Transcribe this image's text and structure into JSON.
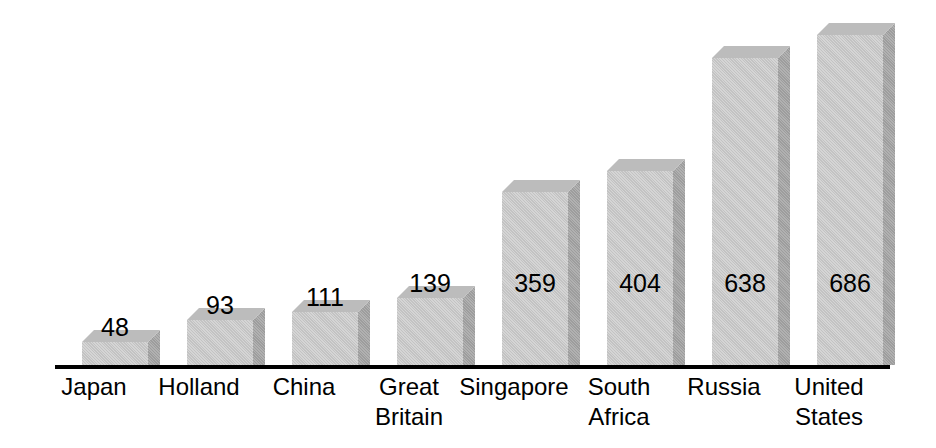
{
  "chart_data": {
    "type": "bar",
    "title": "",
    "subtitle": "",
    "xlabel": "",
    "ylabel": "",
    "grid": false,
    "legend": "none",
    "style": "3d-block-bars-grayscale",
    "axis_line": true,
    "y_axis_visible": false,
    "ylim": [
      0,
      686
    ],
    "categories": [
      "Japan",
      "Holland",
      "China",
      "Great Britain",
      "Singapore",
      "South Africa",
      "Russia",
      "United States"
    ],
    "values": [
      48,
      93,
      111,
      139,
      359,
      404,
      638,
      686
    ],
    "value_label_position": [
      "above",
      "above",
      "above",
      "above",
      "inside",
      "inside",
      "inside",
      "inside"
    ]
  },
  "colors": {
    "background": "#ffffff",
    "bar_front": "#c9c9c9",
    "bar_top": "#bcbcbc",
    "bar_side": "#a2a2a2",
    "axis": "#000000",
    "text": "#000000"
  },
  "bars": [
    {
      "name": "japan",
      "category_lines": [
        "Japan"
      ],
      "value_text": "48",
      "value": 48,
      "left": 82,
      "height": 23,
      "label_top": 314,
      "label_inside": false,
      "cat_left": 38
    },
    {
      "name": "holland",
      "category_lines": [
        "Holland"
      ],
      "value_text": "93",
      "value": 93,
      "left": 187,
      "height": 45,
      "label_top": 292,
      "label_inside": false,
      "cat_left": 143
    },
    {
      "name": "china",
      "category_lines": [
        "China"
      ],
      "value_text": "111",
      "value": 111,
      "left": 292,
      "height": 53,
      "label_top": 284,
      "label_inside": false,
      "cat_left": 248
    },
    {
      "name": "great-britain",
      "category_lines": [
        "Great",
        "Britain"
      ],
      "value_text": "139",
      "value": 139,
      "left": 397,
      "height": 67,
      "label_top": 270,
      "label_inside": false,
      "cat_left": 353
    },
    {
      "name": "singapore",
      "category_lines": [
        "Singapore"
      ],
      "value_text": "359",
      "value": 359,
      "left": 502,
      "height": 173,
      "label_top": 270,
      "label_inside": true,
      "cat_left": 458
    },
    {
      "name": "south-africa",
      "category_lines": [
        "South",
        "Africa"
      ],
      "value_text": "404",
      "value": 404,
      "left": 607,
      "height": 194,
      "label_top": 270,
      "label_inside": true,
      "cat_left": 563
    },
    {
      "name": "russia",
      "category_lines": [
        "Russia"
      ],
      "value_text": "638",
      "value": 638,
      "left": 712,
      "height": 307,
      "label_top": 270,
      "label_inside": true,
      "cat_left": 668
    },
    {
      "name": "united-states",
      "category_lines": [
        "United",
        "States"
      ],
      "value_text": "686",
      "value": 686,
      "left": 817,
      "height": 330,
      "label_top": 270,
      "label_inside": true,
      "cat_left": 773
    }
  ]
}
